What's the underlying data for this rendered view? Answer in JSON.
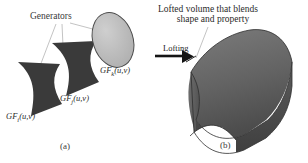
{
  "figure": {
    "title_left": "Generators",
    "title_right_line1": "Lofted volume that blends",
    "title_right_line2": "shape and property",
    "arrow_label": "Lofting",
    "param_label": "t",
    "generators": [
      {
        "name": "generator-i",
        "label": "GF",
        "subscript": "i",
        "args": "(u,v)",
        "fill": "#3a3a3a",
        "kind": "bowtie"
      },
      {
        "name": "generator-j",
        "label": "GF",
        "subscript": "j",
        "args": "(u,v)",
        "fill": "#3a3a3a",
        "kind": "bowtie"
      },
      {
        "name": "generator-k",
        "label": "GF",
        "subscript": "k",
        "args": "(u,v)",
        "fill": "#b8b8b8",
        "kind": "ellipse"
      }
    ],
    "solid": {
      "name": "lofted-volume",
      "fill_top": "#6a6a6a",
      "fill_front": "#4f4f4f",
      "fill_end": "#5e5e5e"
    },
    "caption_a": "(a)",
    "caption_b": "(b)",
    "colors": {
      "ink": "#2b2b2b",
      "dark_shape": "#3a3a3a",
      "light_shape": "#b8b8b8",
      "leader": "#9a9a9a"
    }
  }
}
